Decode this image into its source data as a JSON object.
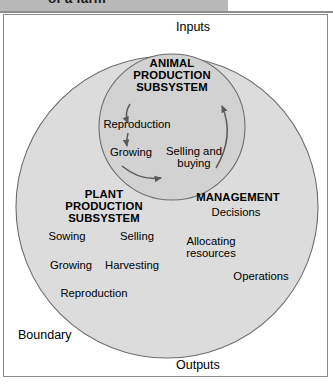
{
  "header": {
    "title": "of a farm"
  },
  "diagram": {
    "inputs_label": "Inputs",
    "outputs_label": "Outputs",
    "boundary_label": "Boundary",
    "subsystems": [
      {
        "id": "animal",
        "title_line1": "ANIMAL",
        "title_line2": "PRODUCTION",
        "title_line3": "SUBSYSTEM",
        "nodes": [
          {
            "label": "Reproduction"
          },
          {
            "label": "Growing"
          },
          {
            "label": "Selling and",
            "label2": "buying"
          }
        ]
      },
      {
        "id": "plant",
        "title_line1": "PLANT",
        "title_line2": "PRODUCTION",
        "title_line3": "SUBSYSTEM",
        "nodes": [
          {
            "label": "Sowing"
          },
          {
            "label": "Growing"
          },
          {
            "label": "Reproduction"
          },
          {
            "label": "Harvesting"
          },
          {
            "label": "Selling"
          }
        ]
      },
      {
        "id": "management",
        "title_line1": "MANAGEMENT",
        "nodes": [
          {
            "label": "Decisions"
          },
          {
            "label": "Allocating",
            "label2": "resources"
          },
          {
            "label": "Operations"
          }
        ]
      }
    ]
  },
  "colors": {
    "circle_fill": "#dcdcdc",
    "circle_stroke": "#6d6d6d",
    "arrow": "#5a5a5a",
    "frame_border": "#8b8b8b",
    "header_band": "#b9b9b9",
    "text": "#000000"
  }
}
